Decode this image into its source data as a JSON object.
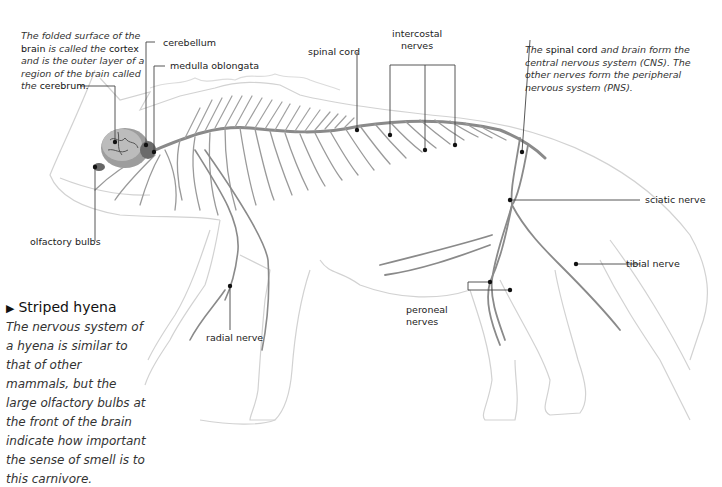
{
  "labels": {
    "cerebellum": "cerebellum",
    "medulla": "medulla oblongata",
    "spinal_cord": "spinal cord",
    "intercostal_1": "intercostal",
    "intercostal_2": "nerves",
    "olfactory": "olfactory bulbs",
    "sciatic": "sciatic nerve",
    "tibial": "tibial nerve",
    "peroneal_1": "peroneal",
    "peroneal_2": "nerves",
    "radial": "radial nerve"
  },
  "notes": {
    "cortex": {
      "t1": "The folded surface of the",
      "b1": "brain",
      "t2": " is called the ",
      "b2": "cortex",
      "t3": "and is the outer layer of a",
      "t4": "region of the brain called",
      "t5": "the ",
      "b3": "cerebrum."
    },
    "cns": {
      "t1": "The ",
      "b1": "spinal cord",
      "t2": " and brain form the",
      "t3": "central nervous system (CNS). The",
      "t4": "other nerves form the peripheral",
      "t5": "nervous system (PNS)."
    }
  },
  "caption": {
    "title": "Striped hyena",
    "marker": "▶",
    "text": "The nervous system of a hyena is similar to that of other mammals, but the large olfactory bulbs at the front of the brain indicate how important the sense of smell is to this carnivore."
  },
  "colors": {
    "nerve": "#8a8a8a",
    "outline": "#cfcfcf",
    "leader": "#444444"
  }
}
